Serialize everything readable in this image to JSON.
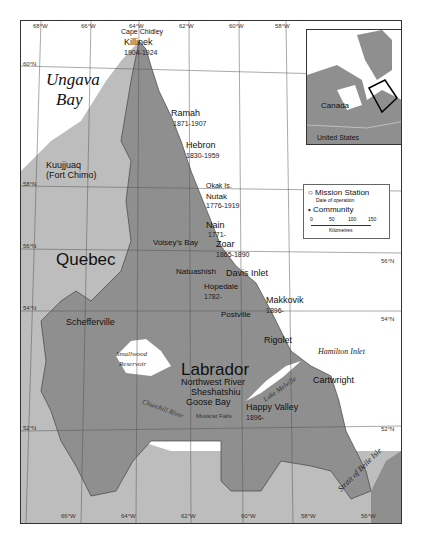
{
  "map": {
    "regions": {
      "quebec": "Quebec",
      "labrador": "Labrador",
      "ungava_1": "Ungava",
      "ungava_2": "Bay"
    },
    "water": {
      "smallwood_1": "Smallwood",
      "smallwood_2": "Reservoir",
      "churchill": "Churchill River",
      "lake_melville": "Lake Melville",
      "hamilton": "Hamilton Inlet",
      "belle_isle": "Strait of Belle Isle"
    },
    "places": {
      "cape_chidley": "Cape Chidley",
      "killinek": "Killinek",
      "killinek_date": "1904-1924",
      "ramah": "Ramah",
      "ramah_date": "1871-1907",
      "hebron": "Hebron",
      "hebron_date": "1830-1959",
      "okak": "Okak Is.",
      "nutak": "Nutak",
      "nutak_date": "1776-1919",
      "nain": "Nain",
      "nain_date": "1771-",
      "voiseys": "Voisey's Bay",
      "zoar": "Zoar",
      "zoar_date": "1865-1890",
      "natuashish": "Natuashish",
      "davis": "Davis Inlet",
      "hopedale": "Hopedale",
      "hopedale_date": "1782-",
      "makkovik": "Makkovik",
      "makkovik_date": "1896-",
      "postville": "Postville",
      "rigolet": "Rigolet",
      "cartwright": "Cartwright",
      "northwest_river": "Northwest River",
      "sheshatshiu": "Sheshatshiu",
      "goose_bay": "Goose Bay",
      "happy_valley": "Happy Valley",
      "happy_valley_date": "1896-",
      "muskrat": "Muskrat Falls",
      "kuujjuaq_1": "Kuujjuaq",
      "kuujjuaq_2": "(Fort Chimo)",
      "schefferville": "Schefferville"
    },
    "lon_ticks_top": [
      "68°W",
      "66°W",
      "64°W",
      "62°W",
      "60°W",
      "58°W"
    ],
    "lon_ticks_bottom": [
      "66°W",
      "64°W",
      "62°W",
      "60°W",
      "58°W",
      "56°W"
    ],
    "lat_ticks_left": [
      "60°N",
      "58°N",
      "56°N",
      "54°N",
      "52°N"
    ],
    "lat_ticks_right": [
      "56°N",
      "54°N",
      "52°N"
    ]
  },
  "inset": {
    "canada": "Canada",
    "us": "United States"
  },
  "legend": {
    "mission": "Mission Station",
    "mission_sub": "Date of operation",
    "community": "Community",
    "scale": [
      "0",
      "50",
      "100",
      "150"
    ],
    "scale_unit": "Kilometres"
  },
  "colors": {
    "labrador": "#8f8f8f",
    "quebec": "#bdbdbd",
    "water": "#ffffff",
    "border": "#444444"
  }
}
